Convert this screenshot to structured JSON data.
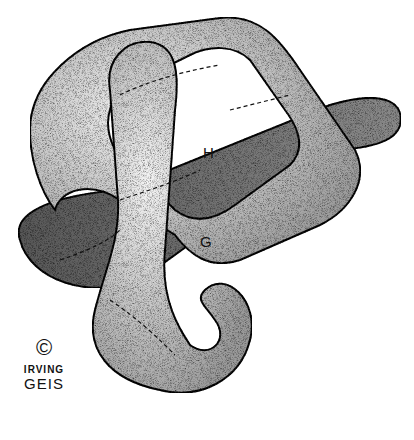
{
  "illustration": {
    "labels": {
      "helix_h": "H",
      "helix_g": "G"
    },
    "signature": {
      "copyright": "©",
      "line1": "IRVING",
      "line2": "GEIS"
    }
  },
  "colors": {
    "band": "#6e6e6e",
    "tube": "#d9d9d9",
    "outline": "#111111"
  }
}
